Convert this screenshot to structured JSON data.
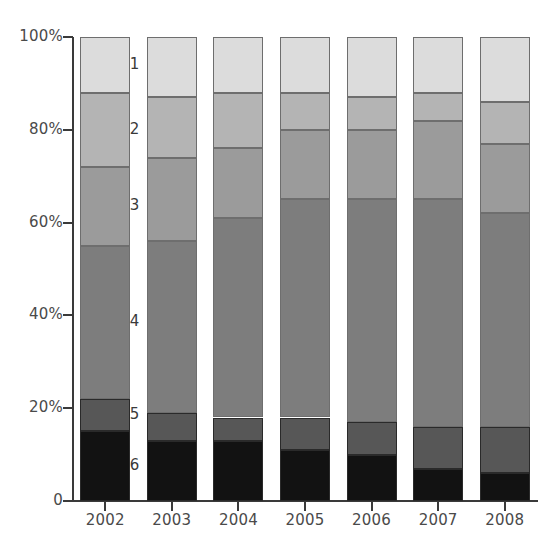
{
  "chart_data": {
    "type": "bar",
    "variant": "stacked-percent",
    "title": "",
    "subtitle": "",
    "xlabel": "",
    "ylabel": "",
    "categories": [
      "2002",
      "2003",
      "2004",
      "2005",
      "2006",
      "2007",
      "2008"
    ],
    "ylim": [
      0,
      100
    ],
    "yticks": [
      0,
      20,
      40,
      60,
      80,
      100
    ],
    "ytick_labels": [
      "0",
      "20%",
      "40%",
      "60%",
      "80%",
      "100%"
    ],
    "grid": false,
    "legend_position": "inline-between-bars",
    "series": [
      {
        "name": "1",
        "color": "#dcdcdc",
        "values": [
          12,
          13,
          12,
          12,
          13,
          12,
          14
        ]
      },
      {
        "name": "2",
        "color": "#b4b4b4",
        "values": [
          16,
          13,
          12,
          8,
          7,
          6,
          9
        ]
      },
      {
        "name": "3",
        "color": "#9b9b9b",
        "values": [
          17,
          18,
          15,
          15,
          15,
          17,
          15
        ]
      },
      {
        "name": "4",
        "color": "#7d7d7d",
        "values": [
          33,
          37,
          43,
          47,
          48,
          49,
          46
        ]
      },
      {
        "name": "5",
        "color": "#575757",
        "values": [
          7,
          6,
          5,
          7,
          7,
          9,
          10
        ]
      },
      {
        "name": "6",
        "color": "#121212",
        "values": [
          15,
          13,
          13,
          11,
          10,
          7,
          6
        ]
      }
    ],
    "series_label_order_top_to_bottom": [
      "1",
      "2",
      "3",
      "4",
      "5",
      "6"
    ],
    "cumulative_tops_percent": {
      "2002": [
        100,
        88,
        72,
        55,
        22,
        15
      ],
      "2003": [
        100,
        87,
        74,
        56,
        19,
        13
      ],
      "2004": [
        100,
        88,
        76,
        61,
        18,
        13
      ],
      "2005": [
        100,
        88,
        80,
        65,
        18,
        11
      ],
      "2006": [
        100,
        87,
        80,
        65,
        17,
        10
      ],
      "2007": [
        100,
        88,
        82,
        65,
        16,
        7
      ],
      "2008": [
        100,
        86,
        77,
        62,
        16,
        6
      ]
    }
  },
  "axis": {
    "y_labels": [
      "100%",
      "80%",
      "60%",
      "40%",
      "20%",
      "0"
    ],
    "y_values": [
      100,
      80,
      60,
      40,
      20,
      0
    ]
  },
  "legend_labels": [
    "1",
    "2",
    "3",
    "4",
    "5",
    "6"
  ]
}
